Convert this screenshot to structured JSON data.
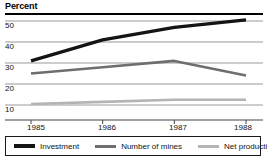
{
  "chart_data": {
    "type": "line",
    "title": "Percent",
    "xlabel": "",
    "ylabel": "Percent",
    "categories": [
      "1985",
      "1986",
      "1987",
      "1988"
    ],
    "x": [
      1985,
      1986,
      1987,
      1988
    ],
    "ylim": [
      0,
      55
    ],
    "yticks": [
      10,
      20,
      30,
      40,
      50
    ],
    "ytick_labels": [
      "10",
      "20",
      "30",
      "40",
      "50"
    ],
    "grid": true,
    "legend_position": "bottom",
    "series": [
      {
        "name": "Investment",
        "color": "#141414",
        "width": 3.2,
        "values": [
          31,
          41,
          47,
          50.5
        ]
      },
      {
        "name": "Number of mines",
        "color": "#6e6e6e",
        "width": 2.6,
        "values": [
          25,
          28,
          31,
          24
        ]
      },
      {
        "name": "Net production",
        "color": "#b4b4b4",
        "width": 2.6,
        "values": [
          10.5,
          11.5,
          12.5,
          12.5
        ]
      }
    ]
  },
  "axis": {
    "ytick_0": "50",
    "ytick_1": "40",
    "ytick_2": "30",
    "ytick_3": "20",
    "ytick_4": "10",
    "xtick_0": "1985",
    "xtick_1": "1986",
    "xtick_2": "1987",
    "xtick_3": "1988"
  },
  "legend": {
    "items": [
      {
        "label": "Investment",
        "color": "#141414"
      },
      {
        "label": "Number of mines",
        "color": "#6e6e6e"
      },
      {
        "label": "Net production",
        "color": "#b4b4b4"
      }
    ]
  },
  "colors": {
    "rule": "#000000",
    "gridline": "#999999",
    "axis": "#444444",
    "text": "#111111"
  }
}
